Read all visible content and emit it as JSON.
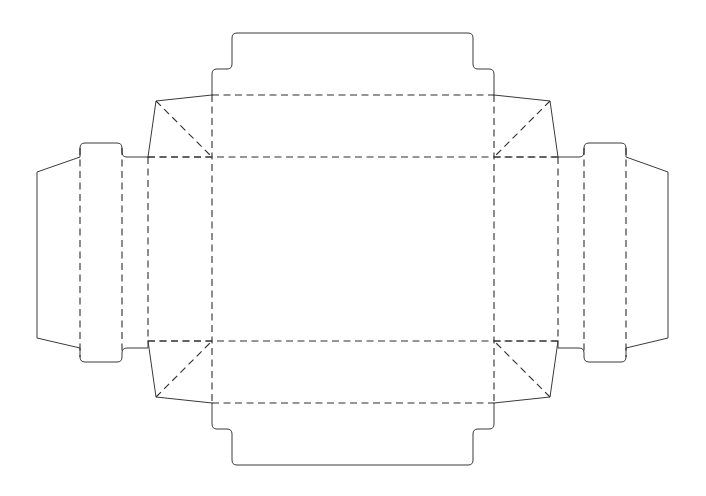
{
  "document": {
    "title": "Box Dieline Template",
    "type": "packaging-dieline",
    "width": 706,
    "height": 496,
    "background_color": "#ffffff"
  },
  "style": {
    "cut_line_color": "#3a3a3a",
    "fold_line_color": "#2e2e2e",
    "cut_line_width": 1,
    "fold_line_width": 1.1,
    "fold_dash_pattern": "7 4.5",
    "corner_radius": 5
  },
  "geometry": {
    "center_panel": {
      "left": 212,
      "right": 494,
      "top": 157,
      "bottom": 341
    },
    "wall_fold": {
      "left": 148,
      "right": 558,
      "top": 95,
      "bottom": 403
    },
    "gusset_points": {
      "top_left": {
        "x": 156,
        "y": 101
      },
      "top_right": {
        "x": 550,
        "y": 101
      },
      "bottom_left": {
        "x": 156,
        "y": 397
      },
      "bottom_right": {
        "x": 550,
        "y": 397
      }
    },
    "top_flap": {
      "base_y": 95,
      "step_y": 69,
      "edge_y": 33,
      "left_x": 212,
      "step_left_x": 222,
      "top_left_x": 232,
      "right_x": 494,
      "step_right_x": 484,
      "top_right_x": 473
    },
    "bottom_flap": {
      "base_y": 403,
      "step_y": 429,
      "edge_y": 465,
      "left_x": 212,
      "step_left_x": 222,
      "top_left_x": 232,
      "right_x": 494,
      "step_right_x": 484,
      "top_right_x": 473
    },
    "left_tab": {
      "outer_x": 37,
      "fold_x": 80,
      "inner_fold_x": 122,
      "notch_x": 148,
      "top_y": 172,
      "bottom_y": 338,
      "notch_top_y": 157,
      "notch_bottom_y": 348,
      "notch_outer_top_y": 143,
      "notch_outer_bottom_y": 362
    },
    "right_tab": {
      "outer_x": 668,
      "fold_x": 626,
      "inner_fold_x": 584,
      "notch_x": 558,
      "top_y": 172,
      "bottom_y": 338,
      "notch_top_y": 157,
      "notch_bottom_y": 348,
      "notch_outer_top_y": 143,
      "notch_outer_bottom_y": 362
    }
  },
  "parts": {
    "center_panel": {
      "name": "Base Panel",
      "role": "box-bottom"
    },
    "top_wall": {
      "name": "Top Side Wall",
      "role": "side-wall"
    },
    "bottom_wall": {
      "name": "Bottom Side Wall",
      "role": "side-wall"
    },
    "left_wall": {
      "name": "Left Side Wall",
      "role": "side-wall"
    },
    "right_wall": {
      "name": "Right Side Wall",
      "role": "side-wall"
    },
    "top_flap": {
      "name": "Top Tuck Flap",
      "role": "closure-flap"
    },
    "bottom_flap": {
      "name": "Bottom Tuck Flap",
      "role": "closure-flap"
    },
    "left_tab": {
      "name": "Left Glue Tab",
      "role": "glue-tab"
    },
    "right_tab": {
      "name": "Right Glue Tab",
      "role": "glue-tab"
    },
    "gussets": {
      "name": "Corner Gusset",
      "role": "corner-fold",
      "count": 4
    }
  },
  "line_legend": {
    "cut": "Solid line — cut",
    "fold": "Dashed line — fold / score"
  }
}
